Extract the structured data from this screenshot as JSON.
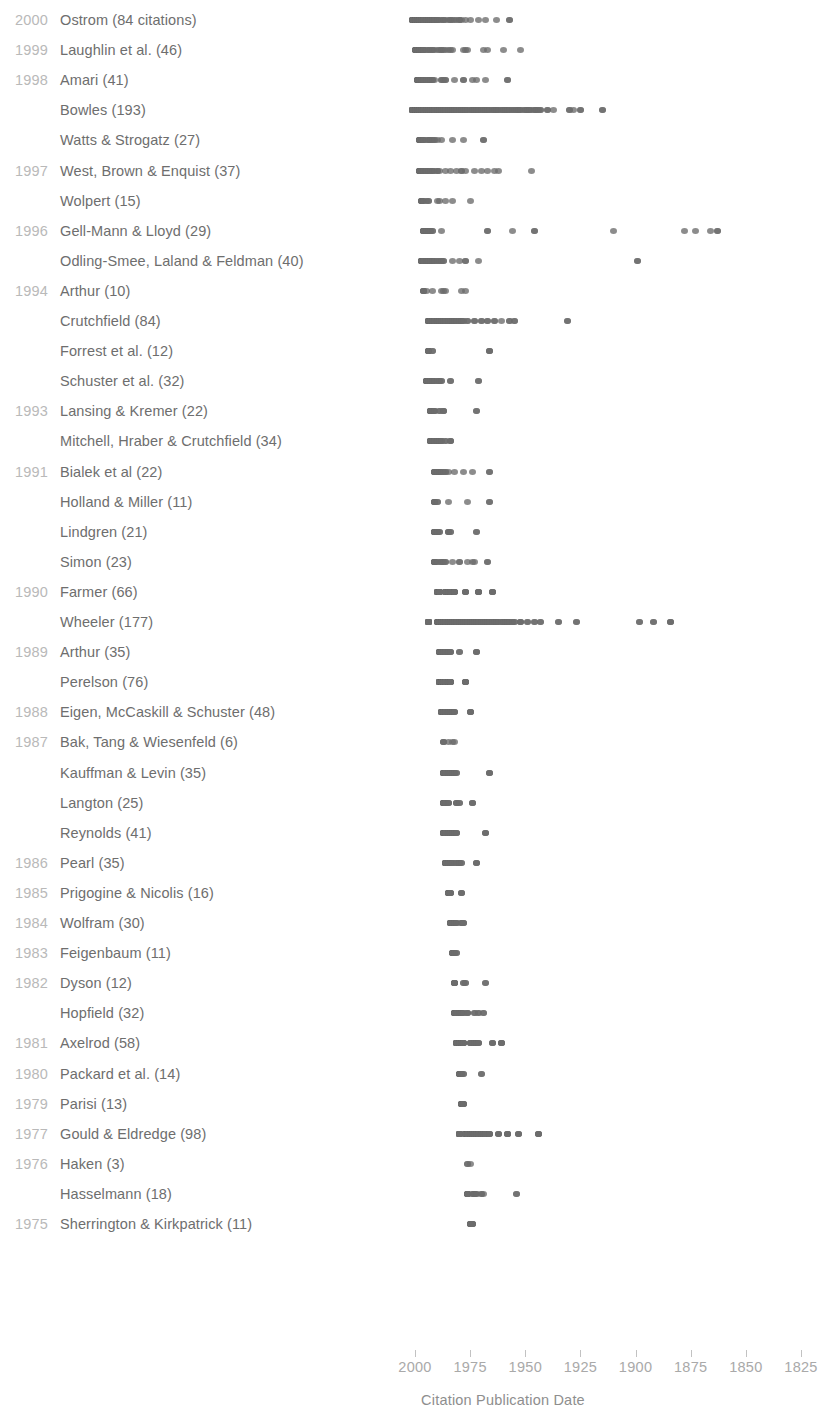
{
  "chart_data": {
    "type": "scatter",
    "title": "",
    "xlabel": "Citation Publication Date",
    "ylabel": "",
    "x_axis": {
      "reversed": true,
      "ticks": [
        2000,
        1975,
        1950,
        1925,
        1900,
        1875,
        1850,
        1825
      ],
      "tick_labels": [
        "2000",
        "1975",
        "1950",
        "1925",
        "1900",
        "1875",
        "1850",
        "1825"
      ],
      "xlim": [
        2012,
        1818
      ],
      "grid": false
    },
    "legend": "none",
    "colors": {
      "dot": "#6b6b6b",
      "year_label": "#b9b9b9",
      "name_label": "#6e6e6e",
      "axis_label": "#a9a9a9",
      "background": "#ffffff"
    },
    "rows": [
      {
        "year": "2000",
        "label": "Ostrom (84 citations)",
        "count": 84,
        "x": [
          2001,
          2000,
          2000,
          1999,
          1999,
          1998,
          1998,
          1997,
          1997,
          1996,
          1996,
          1995,
          1995,
          1994,
          1994,
          1993,
          1993,
          1992,
          1992,
          1991,
          1991,
          1990,
          1990,
          1989,
          1988,
          1987,
          1986,
          1985,
          1984,
          1983,
          1982,
          1981,
          1980,
          1979,
          1977,
          1975,
          1971,
          1968,
          1963,
          1957
        ]
      },
      {
        "year": "1999",
        "label": "Laughlin et al. (46)",
        "count": 46,
        "x": [
          2000,
          1999,
          1998,
          1998,
          1997,
          1996,
          1996,
          1995,
          1994,
          1993,
          1992,
          1991,
          1990,
          1989,
          1988,
          1987,
          1986,
          1985,
          1984,
          1983,
          1978,
          1977,
          1976,
          1969,
          1967,
          1960,
          1952
        ]
      },
      {
        "year": "1998",
        "label": "Amari (41)",
        "count": 41,
        "x": [
          1999,
          1998,
          1997,
          1996,
          1995,
          1994,
          1993,
          1992,
          1991,
          1988,
          1987,
          1986,
          1982,
          1978,
          1974,
          1972,
          1968,
          1958
        ]
      },
      {
        "year": "1998b",
        "label": "Bowles (193)",
        "count": 193,
        "x": [
          2001,
          2000,
          1999,
          1998,
          1997,
          1996,
          1995,
          1994,
          1993,
          1992,
          1991,
          1990,
          1989,
          1988,
          1987,
          1986,
          1985,
          1984,
          1983,
          1982,
          1981,
          1980,
          1979,
          1978,
          1977,
          1976,
          1975,
          1974,
          1973,
          1972,
          1971,
          1970,
          1969,
          1968,
          1967,
          1966,
          1965,
          1964,
          1963,
          1962,
          1961,
          1960,
          1959,
          1958,
          1957,
          1956,
          1955,
          1954,
          1953,
          1952,
          1951,
          1950,
          1949,
          1948,
          1947,
          1946,
          1945,
          1944,
          1943,
          1940,
          1937,
          1930,
          1928,
          1925,
          1915
        ]
      },
      {
        "year": "1998c",
        "label": "Watts & Strogatz (27)",
        "count": 27,
        "x": [
          1998,
          1997,
          1996,
          1995,
          1994,
          1993,
          1992,
          1991,
          1990,
          1988,
          1983,
          1978,
          1969
        ]
      },
      {
        "year": "1997",
        "label": "West, Brown & Enquist (37)",
        "count": 37,
        "x": [
          1998,
          1997,
          1996,
          1995,
          1994,
          1993,
          1992,
          1991,
          1990,
          1989,
          1986,
          1984,
          1981,
          1979,
          1977,
          1973,
          1970,
          1967,
          1964,
          1962,
          1947
        ]
      },
      {
        "year": "1997b",
        "label": "Wolpert (15)",
        "count": 15,
        "x": [
          1997,
          1996,
          1995,
          1994,
          1990,
          1989,
          1986,
          1983,
          1975
        ]
      },
      {
        "year": "1996",
        "label": "Gell-Mann & Lloyd (29)",
        "count": 29,
        "x": [
          1996,
          1995,
          1994,
          1993,
          1992,
          1988,
          1967,
          1956,
          1946,
          1910,
          1878,
          1873,
          1866,
          1863
        ]
      },
      {
        "year": "1996b",
        "label": "Odling-Smee, Laland & Feldman (40)",
        "count": 40,
        "x": [
          1997,
          1996,
          1995,
          1994,
          1993,
          1992,
          1991,
          1990,
          1989,
          1988,
          1987,
          1983,
          1980,
          1977,
          1971,
          1899
        ]
      },
      {
        "year": "1994",
        "label": "Arthur (10)",
        "count": 10,
        "x": [
          1996,
          1995,
          1992,
          1988,
          1987,
          1986,
          1979,
          1977
        ]
      },
      {
        "year": "1994b",
        "label": "Crutchfield (84)",
        "count": 84,
        "x": [
          1994,
          1993,
          1992,
          1991,
          1990,
          1989,
          1988,
          1987,
          1986,
          1985,
          1984,
          1983,
          1982,
          1981,
          1980,
          1979,
          1978,
          1976,
          1973,
          1970,
          1967,
          1964,
          1961,
          1957,
          1955,
          1931
        ]
      },
      {
        "year": "1994c",
        "label": "Forrest et al. (12)",
        "count": 12,
        "x": [
          1994,
          1992,
          1966
        ]
      },
      {
        "year": "1994d",
        "label": "Schuster et al. (32)",
        "count": 32,
        "x": [
          1995,
          1994,
          1993,
          1992,
          1991,
          1990,
          1989,
          1988,
          1984,
          1971
        ]
      },
      {
        "year": "1993",
        "label": "Lansing & Kremer (22)",
        "count": 22,
        "x": [
          1993,
          1992,
          1991,
          1989,
          1987,
          1972
        ]
      },
      {
        "year": "1993b",
        "label": "Mitchell, Hraber & Crutchfield (34)",
        "count": 34,
        "x": [
          1993,
          1992,
          1991,
          1990,
          1989,
          1988,
          1986,
          1984
        ]
      },
      {
        "year": "1991",
        "label": "Bialek et al (22)",
        "count": 22,
        "x": [
          1991,
          1990,
          1989,
          1988,
          1987,
          1986,
          1985,
          1982,
          1978,
          1974,
          1966
        ]
      },
      {
        "year": "1991b",
        "label": "Holland & Miller (11)",
        "count": 11,
        "x": [
          1991,
          1990,
          1985,
          1976,
          1966
        ]
      },
      {
        "year": "1991c",
        "label": "Lindgren (21)",
        "count": 21,
        "x": [
          1991,
          1990,
          1989,
          1985,
          1984,
          1972
        ]
      },
      {
        "year": "1991d",
        "label": "Simon (23)",
        "count": 23,
        "x": [
          1991,
          1990,
          1988,
          1987,
          1986,
          1983,
          1980,
          1976,
          1974,
          1973,
          1967
        ]
      },
      {
        "year": "1990",
        "label": "Farmer (66)",
        "count": 66,
        "x": [
          1990,
          1989,
          1986,
          1985,
          1984,
          1982,
          1977,
          1971,
          1965
        ]
      },
      {
        "year": "1990b",
        "label": "Wheeler (177)",
        "count": 177,
        "x": [
          1994,
          1990,
          1989,
          1988,
          1987,
          1986,
          1985,
          1984,
          1983,
          1982,
          1981,
          1980,
          1979,
          1978,
          1977,
          1976,
          1975,
          1974,
          1973,
          1972,
          1971,
          1970,
          1969,
          1968,
          1967,
          1966,
          1965,
          1964,
          1963,
          1962,
          1961,
          1960,
          1959,
          1958,
          1957,
          1956,
          1955,
          1952,
          1949,
          1946,
          1943,
          1935,
          1927,
          1898,
          1892,
          1884
        ]
      },
      {
        "year": "1989",
        "label": "Arthur (35)",
        "count": 35,
        "x": [
          1989,
          1988,
          1987,
          1986,
          1985,
          1984,
          1980,
          1972
        ]
      },
      {
        "year": "1989b",
        "label": "Perelson (76)",
        "count": 76,
        "x": [
          1989,
          1988,
          1987,
          1986,
          1985,
          1984,
          1977
        ]
      },
      {
        "year": "1988",
        "label": "Eigen, McCaskill & Schuster (48)",
        "count": 48,
        "x": [
          1988,
          1987,
          1986,
          1985,
          1984,
          1983,
          1982,
          1975
        ]
      },
      {
        "year": "1987",
        "label": "Bak, Tang & Wiesenfeld (6)",
        "count": 6,
        "x": [
          1987,
          1985,
          1983,
          1982
        ]
      },
      {
        "year": "1987b",
        "label": "Kauffman & Levin (35)",
        "count": 35,
        "x": [
          1987,
          1986,
          1985,
          1984,
          1983,
          1982,
          1981,
          1966
        ]
      },
      {
        "year": "1987c",
        "label": "Langton (25)",
        "count": 25,
        "x": [
          1987,
          1986,
          1985,
          1981,
          1980,
          1974
        ]
      },
      {
        "year": "1987d",
        "label": "Reynolds (41)",
        "count": 41,
        "x": [
          1987,
          1986,
          1985,
          1984,
          1983,
          1982,
          1981,
          1968
        ]
      },
      {
        "year": "1986",
        "label": "Pearl (35)",
        "count": 35,
        "x": [
          1986,
          1985,
          1984,
          1983,
          1981,
          1980,
          1979,
          1972
        ]
      },
      {
        "year": "1985",
        "label": "Prigogine & Nicolis (16)",
        "count": 16,
        "x": [
          1985,
          1984,
          1979
        ]
      },
      {
        "year": "1984",
        "label": "Wolfram (30)",
        "count": 30,
        "x": [
          1984,
          1983,
          1982,
          1981,
          1979,
          1978
        ]
      },
      {
        "year": "1983",
        "label": "Feigenbaum (11)",
        "count": 11,
        "x": [
          1983,
          1982,
          1981
        ]
      },
      {
        "year": "1982",
        "label": "Dyson (12)",
        "count": 12,
        "x": [
          1982,
          1978,
          1977,
          1968
        ]
      },
      {
        "year": "1982b",
        "label": "Hopfield (32)",
        "count": 32,
        "x": [
          1982,
          1981,
          1980,
          1979,
          1978,
          1976,
          1973,
          1971,
          1969
        ]
      },
      {
        "year": "1981",
        "label": "Axelrod (58)",
        "count": 58,
        "x": [
          1981,
          1980,
          1979,
          1978,
          1975,
          1973,
          1972,
          1971,
          1965,
          1961
        ]
      },
      {
        "year": "1980",
        "label": "Packard et al. (14)",
        "count": 14,
        "x": [
          1980,
          1979,
          1978,
          1970
        ]
      },
      {
        "year": "1979",
        "label": "Parisi (13)",
        "count": 13,
        "x": [
          1979,
          1978
        ]
      },
      {
        "year": "1977",
        "label": "Gould & Eldredge (98)",
        "count": 98,
        "x": [
          1980,
          1977,
          1976,
          1975,
          1974,
          1973,
          1972,
          1971,
          1970,
          1969,
          1968,
          1966,
          1962,
          1958,
          1953,
          1944
        ]
      },
      {
        "year": "1976",
        "label": "Haken (3)",
        "count": 3,
        "x": [
          1976,
          1975
        ]
      },
      {
        "year": "1976b",
        "label": "Hasselmann (18)",
        "count": 18,
        "x": [
          1976,
          1974,
          1973,
          1972,
          1970,
          1969,
          1954
        ]
      },
      {
        "year": "1975",
        "label": "Sherrington & Kirkpatrick (11)",
        "count": 11,
        "x": [
          1975,
          1974
        ]
      }
    ]
  },
  "rows_display": [
    {
      "year": "2000",
      "name": "Ostrom (84 citations)"
    },
    {
      "year": "1999",
      "name": "Laughlin et al. (46)"
    },
    {
      "year": "1998",
      "name": "Amari (41)"
    },
    {
      "year": "",
      "name": "Bowles (193)"
    },
    {
      "year": "",
      "name": "Watts & Strogatz (27)"
    },
    {
      "year": "1997",
      "name": "West, Brown & Enquist (37)"
    },
    {
      "year": "",
      "name": "Wolpert (15)"
    },
    {
      "year": "1996",
      "name": "Gell-Mann & Lloyd (29)"
    },
    {
      "year": "",
      "name": "Odling-Smee, Laland & Feldman (40)"
    },
    {
      "year": "1994",
      "name": "Arthur (10)"
    },
    {
      "year": "",
      "name": "Crutchfield (84)"
    },
    {
      "year": "",
      "name": "Forrest et al. (12)"
    },
    {
      "year": "",
      "name": "Schuster et al. (32)"
    },
    {
      "year": "1993",
      "name": "Lansing & Kremer (22)"
    },
    {
      "year": "",
      "name": "Mitchell, Hraber & Crutchfield (34)"
    },
    {
      "year": "1991",
      "name": "Bialek et al (22)"
    },
    {
      "year": "",
      "name": "Holland & Miller (11)"
    },
    {
      "year": "",
      "name": "Lindgren (21)"
    },
    {
      "year": "",
      "name": "Simon (23)"
    },
    {
      "year": "1990",
      "name": "Farmer (66)"
    },
    {
      "year": "",
      "name": "Wheeler (177)"
    },
    {
      "year": "1989",
      "name": "Arthur (35)"
    },
    {
      "year": "",
      "name": "Perelson (76)"
    },
    {
      "year": "1988",
      "name": "Eigen, McCaskill & Schuster (48)"
    },
    {
      "year": "1987",
      "name": "Bak, Tang & Wiesenfeld (6)"
    },
    {
      "year": "",
      "name": "Kauffman & Levin (35)"
    },
    {
      "year": "",
      "name": "Langton (25)"
    },
    {
      "year": "",
      "name": "Reynolds (41)"
    },
    {
      "year": "1986",
      "name": "Pearl (35)"
    },
    {
      "year": "1985",
      "name": "Prigogine & Nicolis (16)"
    },
    {
      "year": "1984",
      "name": "Wolfram (30)"
    },
    {
      "year": "1983",
      "name": "Feigenbaum (11)"
    },
    {
      "year": "1982",
      "name": "Dyson (12)"
    },
    {
      "year": "",
      "name": "Hopfield (32)"
    },
    {
      "year": "1981",
      "name": "Axelrod (58)"
    },
    {
      "year": "1980",
      "name": "Packard et al. (14)"
    },
    {
      "year": "1979",
      "name": "Parisi (13)"
    },
    {
      "year": "1977",
      "name": "Gould & Eldredge (98)"
    },
    {
      "year": "1976",
      "name": "Haken (3)"
    },
    {
      "year": "",
      "name": "Hasselmann (18)"
    },
    {
      "year": "1975",
      "name": "Sherrington & Kirkpatrick (11)"
    }
  ]
}
